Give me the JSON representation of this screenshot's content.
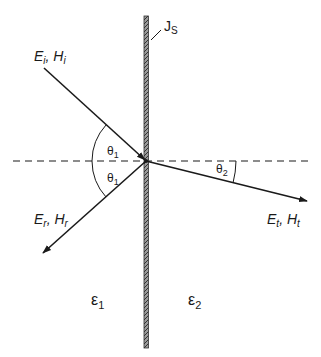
{
  "diagram": {
    "surface_current_label": "J",
    "surface_current_sub": "S",
    "incident": {
      "e": "E",
      "e_sub": "i",
      "h": "H",
      "h_sub": "i",
      "sep": ", "
    },
    "reflected": {
      "e": "E",
      "e_sub": "r",
      "h": "H",
      "h_sub": "r",
      "sep": ", "
    },
    "transmitted": {
      "e": "E",
      "e_sub": "t",
      "h": "H",
      "h_sub": "t",
      "sep": ", "
    },
    "angles": {
      "incident": {
        "sym": "θ",
        "sub": "1"
      },
      "reflected": {
        "sym": "θ",
        "sub": "1"
      },
      "transmitted": {
        "sym": "θ",
        "sub": "2"
      }
    },
    "media": {
      "left": {
        "sym": "ε",
        "sub": "1"
      },
      "right": {
        "sym": "ε",
        "sub": "2"
      }
    },
    "colors": {
      "line": "#1a1a1a",
      "slab_fill": "#8a8a8a",
      "slab_edge": "#333333",
      "background": "#ffffff"
    }
  }
}
